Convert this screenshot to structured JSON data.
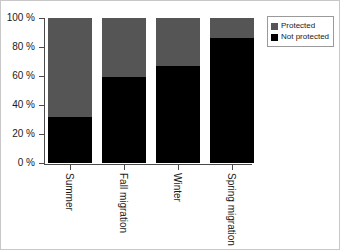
{
  "chart_data": {
    "type": "bar",
    "subtype": "stacked-100-percent",
    "title": "",
    "xlabel": "",
    "ylabel": "",
    "ylim": [
      0,
      100
    ],
    "yticks": [
      0,
      20,
      40,
      60,
      80,
      100
    ],
    "ytick_labels": [
      "0 %",
      "20 %",
      "40 %",
      "60 %",
      "80 %",
      "100 %"
    ],
    "grid": false,
    "legend_position": "top-right",
    "categories": [
      "Summer",
      "Fall migration",
      "Winter",
      "Spring migration"
    ],
    "series": [
      {
        "name": "Protected",
        "color": "#555555",
        "values": [
          68,
          41,
          33,
          14
        ]
      },
      {
        "name": "Not protected",
        "color": "#000000",
        "values": [
          32,
          59,
          67,
          86
        ]
      }
    ]
  },
  "legend": {
    "items": [
      {
        "label": "Protected",
        "color": "#555555"
      },
      {
        "label": "Not protected",
        "color": "#000000"
      }
    ]
  }
}
